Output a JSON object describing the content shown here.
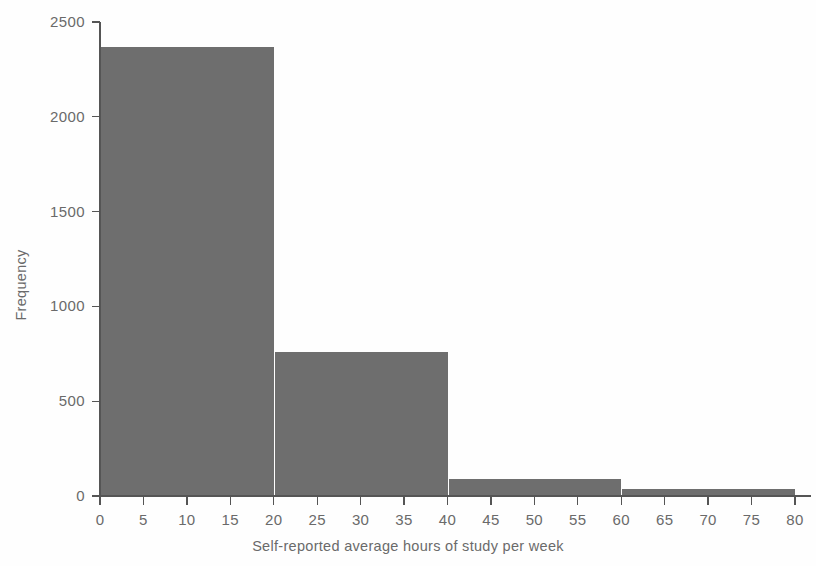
{
  "chart_data": {
    "type": "bar",
    "title": "",
    "subtitle": "",
    "xlabel": "Self-reported average hours of study per week",
    "ylabel": "Frequency",
    "categories": [
      "0-20",
      "20-40",
      "40-60",
      "60-80"
    ],
    "bin_edges": [
      0,
      20,
      40,
      60,
      80
    ],
    "bin_width": 20,
    "values": [
      2370,
      760,
      90,
      35
    ],
    "xlim": [
      0,
      80
    ],
    "ylim": [
      0,
      2500
    ],
    "xticks": [
      0,
      5,
      10,
      15,
      20,
      25,
      30,
      35,
      40,
      45,
      50,
      55,
      60,
      65,
      70,
      75,
      80
    ],
    "yticks": [
      0,
      500,
      1000,
      1500,
      2000,
      2500
    ],
    "xtick_labels": [
      "0",
      "5",
      "10",
      "15",
      "20",
      "25",
      "30",
      "35",
      "40",
      "45",
      "50",
      "55",
      "60",
      "65",
      "70",
      "75",
      "80"
    ],
    "ytick_labels": [
      "0",
      "500",
      "1000",
      "1500",
      "2000",
      "2500"
    ],
    "grid": false,
    "legend": false,
    "legend_position": "none",
    "annotations": [],
    "colors": {
      "bar_fill": "#6e6e6e",
      "axis": "#555555",
      "text": "#6a6a6a",
      "background": "#fefefe"
    }
  }
}
